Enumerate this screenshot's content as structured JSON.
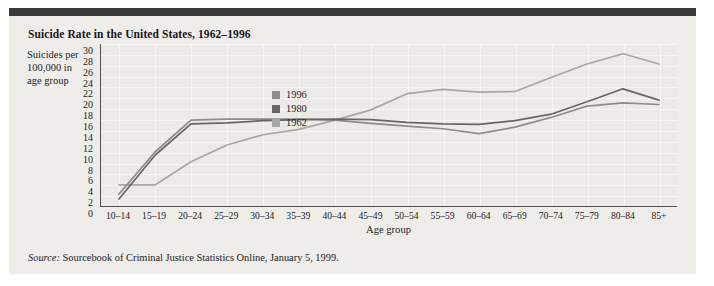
{
  "figure": {
    "title": "Suicide Rate in the United States, 1962–1996",
    "source_prefix": "Source:",
    "source_text": "Sourcebook of Criminal Justice Statistics Online, January 5, 1999.",
    "ylabel": "Suicides per 100,000 in age group",
    "xlabel": "Age group"
  },
  "chart_data": {
    "type": "line",
    "title": "Suicide Rate in the United States, 1962–1996",
    "xlabel": "Age group",
    "ylabel": "Suicides per 100,000 in age group",
    "categories": [
      "10–14",
      "15–19",
      "20–24",
      "25–29",
      "30–34",
      "35–39",
      "40–44",
      "45–49",
      "50–54",
      "55–59",
      "60–64",
      "65–69",
      "70–74",
      "75–79",
      "80–84",
      "85+"
    ],
    "ytick_labels": [
      "30",
      "28",
      "26",
      "24",
      "22",
      "20",
      "18",
      "16",
      "14",
      "12",
      "10",
      "8",
      "6",
      "4",
      "2",
      "0"
    ],
    "ylim": [
      0,
      30
    ],
    "ytick_step": 2,
    "grid": true,
    "legend_position": "inside-upper-center",
    "series": [
      {
        "name": "1996",
        "color": "#8c8c8c",
        "values": [
          2.2,
          10.0,
          15.9,
          16.1,
          16.1,
          16.1,
          15.9,
          15.3,
          14.8,
          14.3,
          13.4,
          14.6,
          16.4,
          18.5,
          19.1,
          18.8
        ]
      },
      {
        "name": "1980",
        "color": "#666666",
        "values": [
          1.3,
          9.4,
          15.2,
          15.4,
          15.8,
          16.0,
          16.1,
          16.0,
          15.5,
          15.2,
          15.1,
          15.8,
          17.0,
          19.3,
          21.7,
          19.6
        ]
      },
      {
        "name": "1962",
        "color": "#a6a6a6",
        "values": [
          3.9,
          3.9,
          8.2,
          11.3,
          13.2,
          14.2,
          15.9,
          17.8,
          20.8,
          21.6,
          21.1,
          21.2,
          23.8,
          26.3,
          28.2,
          26.3
        ]
      }
    ],
    "legend": [
      {
        "label": "1996",
        "color": "#8c8c8c"
      },
      {
        "label": "1980",
        "color": "#666666"
      },
      {
        "label": "1962",
        "color": "#a6a6a6"
      }
    ]
  }
}
